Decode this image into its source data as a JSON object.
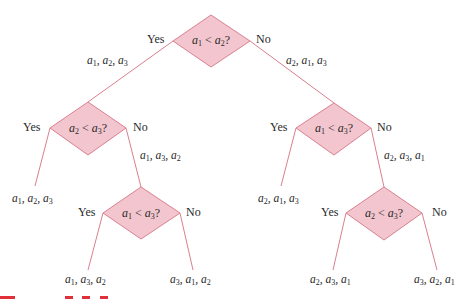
{
  "diagram": {
    "type": "decision-tree",
    "colors": {
      "edge": "#d9808f",
      "node_fill": "#f3c6cf",
      "node_stroke": "#d9808f",
      "text": "#2a2a2a",
      "marks": "#e0303a"
    },
    "nodes": [
      {
        "id": "root",
        "condition": {
          "left": "a",
          "left_sub": "1",
          "op": "<",
          "right": "a",
          "right_sub": "2",
          "q": "?"
        },
        "yes_label": "Yes",
        "no_label": "No",
        "yes_edge_label": {
          "parts": [
            [
              "a",
              "1"
            ],
            [
              "a",
              "2"
            ],
            [
              "a",
              "3"
            ]
          ]
        },
        "no_edge_label": {
          "parts": [
            [
              "a",
              "2"
            ],
            [
              "a",
              "1"
            ],
            [
              "a",
              "3"
            ]
          ]
        }
      },
      {
        "id": "left",
        "condition": {
          "left": "a",
          "left_sub": "2",
          "op": "<",
          "right": "a",
          "right_sub": "3",
          "q": "?"
        },
        "yes_label": "Yes",
        "no_label": "No",
        "yes_leaf": {
          "parts": [
            [
              "a",
              "1"
            ],
            [
              "a",
              "2"
            ],
            [
              "a",
              "3"
            ]
          ]
        },
        "no_edge_label": {
          "parts": [
            [
              "a",
              "1"
            ],
            [
              "a",
              "3"
            ],
            [
              "a",
              "2"
            ]
          ]
        }
      },
      {
        "id": "right",
        "condition": {
          "left": "a",
          "left_sub": "1",
          "op": "<",
          "right": "a",
          "right_sub": "3",
          "q": "?"
        },
        "yes_label": "Yes",
        "no_label": "No",
        "yes_leaf": {
          "parts": [
            [
              "a",
              "2"
            ],
            [
              "a",
              "1"
            ],
            [
              "a",
              "3"
            ]
          ]
        },
        "no_edge_label": {
          "parts": [
            [
              "a",
              "2"
            ],
            [
              "a",
              "3"
            ],
            [
              "a",
              "1"
            ]
          ]
        }
      },
      {
        "id": "left-bottom",
        "condition": {
          "left": "a",
          "left_sub": "1",
          "op": "<",
          "right": "a",
          "right_sub": "3",
          "q": "?"
        },
        "yes_label": "Yes",
        "no_label": "No",
        "yes_leaf": {
          "parts": [
            [
              "a",
              "1"
            ],
            [
              "a",
              "3"
            ],
            [
              "a",
              "2"
            ]
          ]
        },
        "no_leaf": {
          "parts": [
            [
              "a",
              "3"
            ],
            [
              "a",
              "1"
            ],
            [
              "a",
              "2"
            ]
          ]
        }
      },
      {
        "id": "right-bottom",
        "condition": {
          "left": "a",
          "left_sub": "2",
          "op": "<",
          "right": "a",
          "right_sub": "3",
          "q": "?"
        },
        "yes_label": "Yes",
        "no_label": "No",
        "yes_leaf": {
          "parts": [
            [
              "a",
              "2"
            ],
            [
              "a",
              "3"
            ],
            [
              "a",
              "1"
            ]
          ]
        },
        "no_leaf": {
          "parts": [
            [
              "a",
              "3"
            ],
            [
              "a",
              "2"
            ],
            [
              "a",
              "1"
            ]
          ]
        }
      }
    ],
    "text": {
      "root_cond": "a1 < a2?",
      "left_cond": "a2 < a3?",
      "right_cond": "a1 < a3?",
      "left_bottom_cond": "a1 < a3?",
      "right_bottom_cond": "a2 < a3?",
      "yes": "Yes",
      "no": "No",
      "root_yes_edge": "a1, a2, a3",
      "root_no_edge": "a2, a1, a3",
      "left_no_edge": "a1, a3, a2",
      "right_no_edge": "a2, a3, a1",
      "leaf_1": "a1, a2, a3",
      "leaf_2": "a1, a3, a2",
      "leaf_3": "a3, a1, a2",
      "leaf_4": "a2, a1, a3",
      "leaf_5": "a2, a3, a1",
      "leaf_6": "a3, a2, a1"
    }
  }
}
